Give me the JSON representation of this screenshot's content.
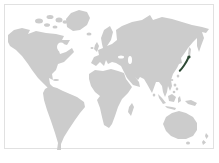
{
  "figure": {
    "type": "map",
    "name": "world-locator-map",
    "highlighted_region": "Japan",
    "visible_landmasses": [
      "North America",
      "Greenland",
      "South America",
      "Europe",
      "Africa",
      "Madagascar",
      "Asia",
      "Southeast Asian islands",
      "Australia",
      "New Zealand",
      "Japan"
    ],
    "colors": {
      "page_background": "#ffffff",
      "frame_border": "#e1e1e1",
      "ocean": "#ffffff",
      "land": "#cccccc",
      "highlight": "#2f4a36"
    }
  }
}
